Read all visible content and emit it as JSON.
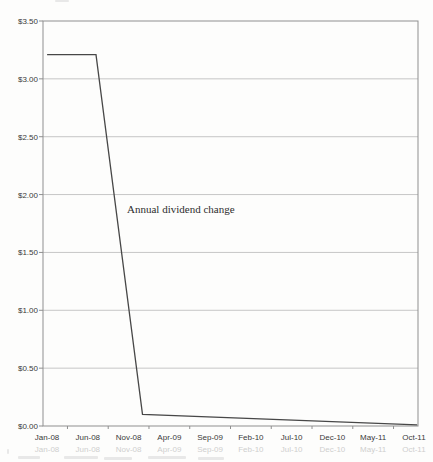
{
  "chart_data": {
    "type": "line",
    "title": "",
    "annotation": "Annual dividend change",
    "xlabel": "",
    "ylabel": "",
    "x_tick_labels": [
      "Jan-08",
      "Jun-08",
      "Nov-08",
      "Apr-09",
      "Sep-09",
      "Feb-10",
      "Jul-10",
      "Dec-10",
      "May-11",
      "Oct-11"
    ],
    "x_tick_month_index": [
      0,
      5,
      10,
      15,
      20,
      25,
      30,
      35,
      40,
      45
    ],
    "y_tick_labels": [
      "$3.50",
      "$3.00",
      "$2.50",
      "$2.00",
      "$1.50",
      "$1.00",
      "$0.50",
      "$0.00"
    ],
    "y_tick_values": [
      3.5,
      3.0,
      2.5,
      2.0,
      1.5,
      1.0,
      0.5,
      0.0
    ],
    "ylim": [
      0,
      3.5
    ],
    "y_step": 0.5,
    "x_unit": "months since Jan-08 (46 monthly categories, Jan-08 through Oct-11)",
    "grid": true,
    "legend": "none",
    "series": [
      {
        "name": "Annual dividend change",
        "color": "#474747",
        "points": [
          {
            "month": "Jan-08",
            "m": 0,
            "value": 3.21
          },
          {
            "month": "Jul-08",
            "m": 6,
            "value": 3.21
          },
          {
            "month": "Dec-08",
            "m": 11.7,
            "value": 0.1
          },
          {
            "month": "Oct-11",
            "m": 45.4,
            "value": 0.01
          }
        ]
      }
    ]
  },
  "colors": {
    "background": "#fdfdfc",
    "plot_border": "#8f8f8f",
    "gridline": "#c6c6c6",
    "series_line": "#474747",
    "tick_text": "#3a3a3a",
    "ghost_echo": "#a9a9a9"
  },
  "notes": {
    "scan_artifacts": "faint bleed-through echo of the x-axis labels and unreadable text tops below the axis (scanned page)"
  }
}
